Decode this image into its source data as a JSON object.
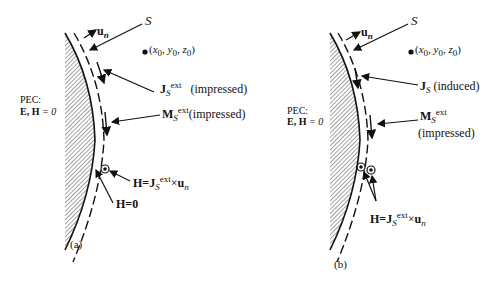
{
  "panels": [
    {
      "caption": "(a)",
      "pec_label": "PEC:",
      "pec_fields": "E, H",
      "pec_value": "= 0",
      "surface_label": "S",
      "normal_label": "u",
      "normal_sub": "n",
      "point_label": "(x",
      "point_full": [
        "x",
        "0",
        "y",
        "0",
        "z",
        "0"
      ],
      "current_J": {
        "symbol": "J",
        "sub": "S",
        "sup": "ext",
        "note": "(impressed)"
      },
      "current_M": {
        "symbol": "M",
        "sub": "S",
        "sup": "ext",
        "note": "(impressed)"
      },
      "field_eq": {
        "lhs": "H=J",
        "sub": "S",
        "sup": "ext",
        "op": "×",
        "rhs": "u",
        "rhs_sub": "n"
      },
      "field_zero": "H=0"
    },
    {
      "caption": "(b)",
      "pec_label": "PEC:",
      "pec_fields": "E, H",
      "pec_value": "= 0",
      "surface_label": "S",
      "normal_label": "u",
      "normal_sub": "n",
      "current_J": {
        "symbol": "J",
        "sub": "S",
        "note": "(induced)"
      },
      "current_M": {
        "symbol": "M",
        "sub": "S",
        "sup": "ext",
        "note": "(impressed)"
      },
      "field_eq": {
        "lhs": "H=J",
        "sub": "S",
        "sup": "ext",
        "op": "×",
        "rhs": "u",
        "rhs_sub": "n"
      }
    }
  ]
}
